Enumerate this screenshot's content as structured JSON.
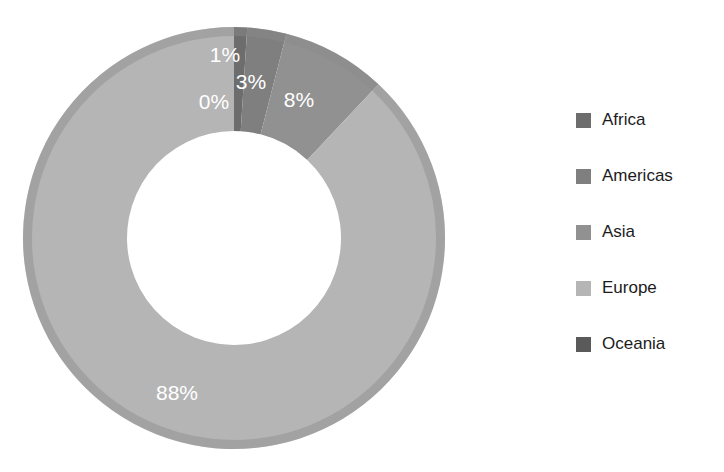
{
  "chart_data": {
    "type": "pie",
    "variant": "donut",
    "title": "",
    "subtitle": "",
    "xlabel": "",
    "ylabel": "",
    "grid": false,
    "legend_position": "right",
    "start_angle_deg": 0,
    "direction": "clockwise",
    "inner_radius_ratio": 0.5,
    "categories": [
      "Africa",
      "Americas",
      "Asia",
      "Europe",
      "Oceania"
    ],
    "values": [
      1,
      3,
      8,
      88,
      0
    ],
    "value_unit": "%",
    "labels": [
      "1%",
      "3%",
      "8%",
      "88%",
      "0%"
    ],
    "colors": [
      "#6d6d6d",
      "#7f7f7f",
      "#919191",
      "#b5b5b5",
      "#5a5a5a"
    ],
    "slices": [
      {
        "name": "Africa",
        "value": 1,
        "label": "1%",
        "color": "#6d6d6d",
        "start_deg": 0,
        "end_deg": 3.6,
        "label_x": 225,
        "label_y": 56
      },
      {
        "name": "Americas",
        "value": 3,
        "label": "3%",
        "color": "#7f7f7f",
        "start_deg": 3.6,
        "end_deg": 14.4,
        "label_x": 251,
        "label_y": 83
      },
      {
        "name": "Asia",
        "value": 8,
        "label": "8%",
        "color": "#919191",
        "start_deg": 14.4,
        "end_deg": 43.2,
        "label_x": 299,
        "label_y": 101
      },
      {
        "name": "Europe",
        "value": 88,
        "label": "88%",
        "color": "#b5b5b5",
        "start_deg": 43.2,
        "end_deg": 360.0,
        "label_x": 177,
        "label_y": 394
      },
      {
        "name": "Oceania",
        "value": 0,
        "label": "0%",
        "color": "#5a5a5a",
        "start_deg": 360.0,
        "end_deg": 360.0,
        "label_x": 214,
        "label_y": 103
      }
    ],
    "geometry": {
      "center_x": 234,
      "center_y": 238,
      "outer_radius": 211,
      "inner_radius": 107,
      "stroke_color": "#8c8c8c",
      "stroke_width": 9
    }
  },
  "legend": {
    "items": [
      {
        "label": "Africa",
        "color": "#6d6d6d"
      },
      {
        "label": "Americas",
        "color": "#7f7f7f"
      },
      {
        "label": "Asia",
        "color": "#919191"
      },
      {
        "label": "Europe",
        "color": "#b5b5b5"
      },
      {
        "label": "Oceania",
        "color": "#5a5a5a"
      }
    ]
  }
}
